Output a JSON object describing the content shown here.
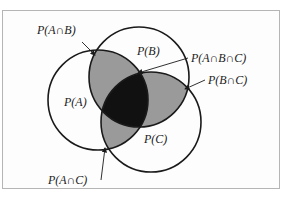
{
  "diagram": {
    "type": "venn",
    "sets": [
      "A",
      "B",
      "C"
    ],
    "colors": {
      "frame_border": "#b5b5b5",
      "pairwise_fill": "#9a9a9a",
      "triple_fill": "#111111",
      "outline": "#1a1a1a",
      "background": "#fdfdfd"
    },
    "labels": {
      "a": "P(A)",
      "b": "P(B)",
      "c": "P(C)",
      "ab": "P(A∩B)",
      "bc": "P(B∩C)",
      "ac": "P(A∩C)",
      "abc": "P(A∩B∩C)"
    }
  }
}
